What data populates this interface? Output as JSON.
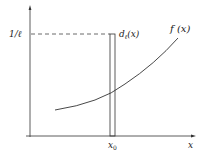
{
  "figure": {
    "labels": {
      "y_tick": "1/ℓ",
      "bar_label_main": "d",
      "bar_label_sub": "ℓ",
      "bar_label_arg": "(x)",
      "curve_label": "f (x)",
      "x_tick_main": "x",
      "x_tick_sub": "0",
      "x_axis": "x"
    },
    "colors": {
      "stroke": "#333333",
      "dash": "#444444",
      "background": "#ffffff"
    }
  }
}
